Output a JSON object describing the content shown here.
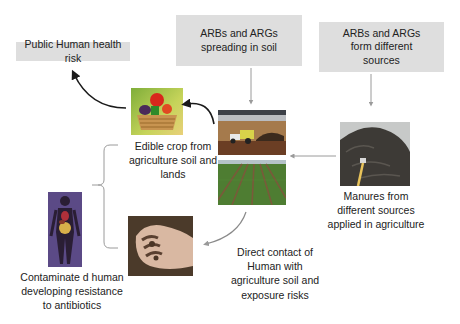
{
  "boxes": {
    "public_health": "Public Human health risk",
    "spreading": "ARBs and ARGs spreading in soil",
    "sources": "ARBs and ARGs form different sources"
  },
  "labels": {
    "edible_crop": "Edible crop from agriculture soil and lands",
    "manures": "Manures from different sources applied in agriculture",
    "direct_contact": "Direct contact of Human with agriculture soil and exposure risks",
    "contaminated": "Contaminate d human developing resistance to antibiotics"
  },
  "images": {
    "vegetables": "vegetable-basket-image",
    "tractor": "tractor-spreading-manure-image",
    "crop_field": "crop-field-rows-image",
    "manure": "manure-pile-image",
    "hand": "soil-covered-hand-image",
    "human_body": "human-anatomy-image"
  },
  "colors": {
    "box_fill": "#dedede",
    "arrow": "#1a1a1a",
    "connector": "#9a9a9a"
  }
}
